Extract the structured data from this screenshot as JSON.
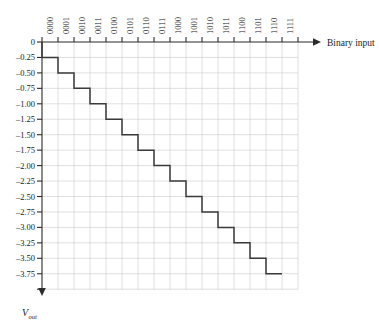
{
  "chart_data": {
    "type": "line",
    "title": "",
    "subtitle": "",
    "xlabel": "Binary input",
    "ylabel": "V_out",
    "ylabel_main": "V",
    "ylabel_sub": "out",
    "categories": [
      "0000",
      "0001",
      "0010",
      "0011",
      "0100",
      "0101",
      "0110",
      "0111",
      "1000",
      "1001",
      "1010",
      "1011",
      "1100",
      "1101",
      "1110",
      "1111"
    ],
    "values": [
      -0.25,
      -0.5,
      -0.75,
      -1.0,
      -1.25,
      -1.5,
      -1.75,
      -2.0,
      -2.25,
      -2.5,
      -2.75,
      -3.0,
      -3.25,
      -3.5,
      -3.75,
      -3.75
    ],
    "step_values": [
      -0.25,
      -0.5,
      -0.75,
      -1.0,
      -1.25,
      -1.5,
      -1.75,
      -2.0,
      -2.25,
      -2.5,
      -2.75,
      -3.0,
      -3.25,
      -3.5,
      -3.75
    ],
    "ytick_labels": [
      "0",
      "–0.25",
      "–0.50",
      "–0.75",
      "–1.00",
      "–1.25",
      "–1.50",
      "–1.75",
      "–2.00",
      "–2.25",
      "–2.50",
      "–2.75",
      "–3.00",
      "–3.25",
      "–3.50",
      "–3.75"
    ],
    "ytick_values": [
      0,
      -0.25,
      -0.5,
      -0.75,
      -1.0,
      -1.25,
      -1.5,
      -1.75,
      -2.0,
      -2.25,
      -2.5,
      -2.75,
      -3.0,
      -3.25,
      -3.5,
      -3.75
    ],
    "ylim": [
      -4.0,
      0
    ],
    "ystep": 0.25,
    "xlim": [
      0,
      16
    ],
    "grid": true,
    "legend": "none",
    "line_color": "#3a3a3a",
    "grid_color": "#c9c9c9",
    "axis_color": "#2b2b2b",
    "annotations": []
  },
  "axis": {
    "x_title": "Binary input",
    "y_title_main": "V",
    "y_title_sub": "out",
    "origin_label": "0"
  }
}
